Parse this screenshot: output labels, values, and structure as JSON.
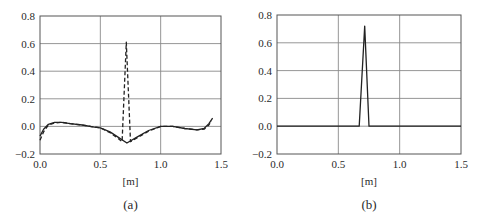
{
  "chart_data": [
    {
      "id": "a",
      "type": "line",
      "caption": "(a)",
      "xlabel": "[m]",
      "ylabel": "",
      "xlim": [
        0.0,
        1.5
      ],
      "ylim": [
        -0.2,
        0.8
      ],
      "xticks": [
        "0.0",
        "0.5",
        "1.0",
        "1.5"
      ],
      "yticks": [
        "0.8",
        "0.6",
        "0.4",
        "0.2",
        "0.0",
        "-0.2"
      ],
      "grid": true,
      "series": [
        {
          "name": "solid",
          "style": "solid",
          "x": [
            0.0,
            0.03,
            0.07,
            0.12,
            0.18,
            0.25,
            0.35,
            0.45,
            0.5,
            0.58,
            0.65,
            0.72,
            0.8,
            0.9,
            1.0,
            1.1,
            1.2,
            1.3,
            1.36,
            1.4,
            1.43
          ],
          "y": [
            -0.07,
            -0.02,
            0.015,
            0.03,
            0.03,
            0.02,
            0.01,
            -0.005,
            -0.01,
            -0.04,
            -0.08,
            -0.12,
            -0.08,
            -0.03,
            0.0,
            0.0,
            -0.015,
            -0.025,
            -0.015,
            0.02,
            0.06
          ]
        },
        {
          "name": "dashed",
          "style": "dashed",
          "x": [
            0.0,
            0.03,
            0.07,
            0.12,
            0.18,
            0.25,
            0.35,
            0.45,
            0.5,
            0.58,
            0.65,
            0.68,
            0.715,
            0.75,
            0.8,
            0.9,
            1.0,
            1.1,
            1.2,
            1.3,
            1.36,
            1.4,
            1.42
          ],
          "y": [
            -0.1,
            -0.04,
            0.01,
            0.025,
            0.03,
            0.02,
            0.01,
            -0.005,
            -0.01,
            -0.045,
            -0.09,
            -0.11,
            0.61,
            -0.11,
            -0.085,
            -0.035,
            0.0,
            0.0,
            -0.015,
            -0.025,
            -0.02,
            0.01,
            0.04
          ]
        }
      ]
    },
    {
      "id": "b",
      "type": "line",
      "caption": "(b)",
      "xlabel": "[m]",
      "ylabel": "",
      "xlim": [
        0.0,
        1.5
      ],
      "ylim": [
        -0.2,
        0.8
      ],
      "xticks": [
        "0.0",
        "0.5",
        "1.0",
        "1.5"
      ],
      "yticks": [
        "0.8",
        "0.6",
        "0.4",
        "0.2",
        "0.0",
        "-0.2"
      ],
      "grid": true,
      "series": [
        {
          "name": "solid",
          "style": "solid",
          "x": [
            0.0,
            0.12,
            0.5,
            0.67,
            0.715,
            0.75,
            1.0,
            1.5
          ],
          "y": [
            0.0,
            0.0,
            0.0,
            0.0,
            0.72,
            0.0,
            0.0,
            0.0
          ]
        }
      ]
    }
  ]
}
